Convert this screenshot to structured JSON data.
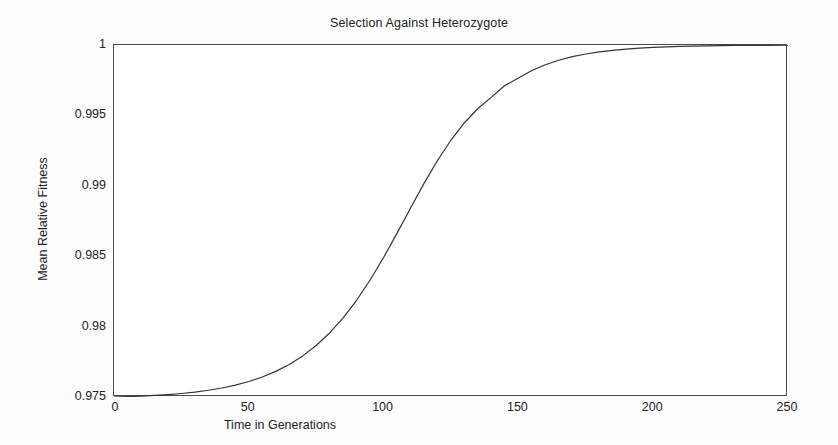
{
  "chart_data": {
    "type": "line",
    "title": "Selection Against Heterozygote",
    "xlabel": "Time in Generations",
    "ylabel": "Mean Relative Fitness",
    "xlim": [
      0,
      250
    ],
    "ylim": [
      0.975,
      1
    ],
    "grid": false,
    "legend": null,
    "xticks": [
      0,
      50,
      100,
      150,
      200,
      250
    ],
    "xtick_labels": [
      "0",
      "50",
      "100",
      "150",
      "200",
      "250"
    ],
    "yticks": [
      0.975,
      0.98,
      0.985,
      0.99,
      0.995,
      1
    ],
    "ytick_labels": [
      "0.975",
      "0.98",
      "0.985",
      "0.99",
      "0.995",
      "1"
    ],
    "line_color": "#333333",
    "series": [
      {
        "name": "Mean Relative Fitness",
        "x": [
          0,
          5,
          10,
          15,
          20,
          25,
          30,
          35,
          40,
          45,
          50,
          55,
          60,
          65,
          70,
          75,
          80,
          85,
          90,
          95,
          100,
          105,
          110,
          115,
          120,
          125,
          130,
          135,
          140,
          145,
          150,
          155,
          160,
          165,
          170,
          175,
          180,
          185,
          190,
          195,
          200,
          210,
          220,
          230,
          240,
          250
        ],
        "values": [
          0.975,
          0.97503,
          0.97506,
          0.97511,
          0.97517,
          0.97525,
          0.97535,
          0.97548,
          0.97564,
          0.97584,
          0.9761,
          0.97642,
          0.97682,
          0.97731,
          0.97792,
          0.97866,
          0.97955,
          0.98062,
          0.98187,
          0.98331,
          0.98491,
          0.98664,
          0.98842,
          0.99017,
          0.9918,
          0.99325,
          0.99448,
          0.99549,
          0.9963,
          0.99712,
          0.99765,
          0.99819,
          0.9986,
          0.99892,
          0.99917,
          0.99936,
          0.99951,
          0.99962,
          0.99971,
          0.99978,
          0.99983,
          0.9999,
          0.99994,
          0.99997,
          0.99998,
          0.99999
        ]
      }
    ]
  }
}
